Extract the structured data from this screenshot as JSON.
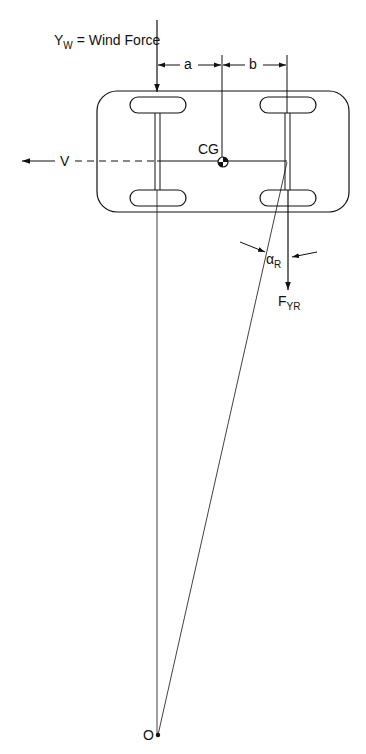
{
  "diagram": {
    "type": "vehicle-lateral-dynamics",
    "labels": {
      "wind_force_main": "Y",
      "wind_force_sub": "W",
      "wind_force_rest": " = Wind Force",
      "dim_a": "a",
      "dim_b": "b",
      "cg": "CG",
      "velocity": "V",
      "slip_angle_main": "α",
      "slip_angle_sub": "R",
      "rear_force_main": "F",
      "rear_force_sub": "YR",
      "origin": "O"
    },
    "colors": {
      "line": "#111111",
      "background": "#ffffff"
    }
  }
}
